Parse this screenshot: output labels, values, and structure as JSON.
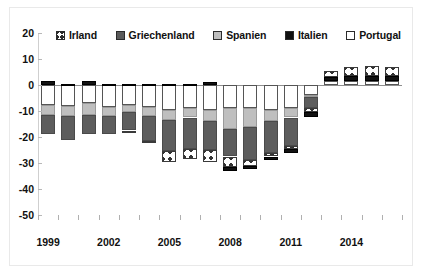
{
  "chart_data": {
    "type": "bar",
    "stacked": true,
    "title": "",
    "subtitle": "",
    "xlabel": "",
    "ylabel": "",
    "ylim": [
      -50,
      20
    ],
    "ytick_step": 10,
    "ytick_labels": [
      "20",
      "10",
      "0",
      "-10",
      "-20",
      "-30",
      "-40",
      "-50"
    ],
    "ytick_values": [
      20,
      10,
      0,
      -10,
      -20,
      -30,
      -40,
      -50
    ],
    "grid": false,
    "legend_position": "top",
    "x": [
      1999,
      2000,
      2001,
      2002,
      2003,
      2004,
      2005,
      2006,
      2007,
      2008,
      2009,
      2010,
      2011,
      2012,
      2013,
      2014,
      2015,
      2016
    ],
    "xtick_labels": [
      "1999",
      "2002",
      "2005",
      "2008",
      "2011",
      "2014"
    ],
    "xtick_values": [
      1999,
      2002,
      2005,
      2008,
      2011,
      2014
    ],
    "categories": [
      "1999",
      "2000",
      "2001",
      "2002",
      "2003",
      "2004",
      "2005",
      "2006",
      "2007",
      "2008",
      "2009",
      "2010",
      "2011",
      "2012",
      "2013",
      "2014",
      "2015",
      "2016"
    ],
    "series": [
      {
        "name": "Irland",
        "color": "#ffffff",
        "pattern": "cross-hatch",
        "values": [
          0,
          0,
          0,
          0,
          -0.5,
          -0.5,
          -4,
          -4,
          -4.5,
          -4,
          -2,
          -1.5,
          -1,
          -1.5,
          2.5,
          3.5,
          4,
          3.5
        ]
      },
      {
        "name": "Griechenland",
        "color": "#5d5d5d",
        "values": [
          -7.5,
          -9,
          -7.5,
          -7,
          -7,
          -9.5,
          -12,
          -12,
          -11,
          -10.5,
          -13,
          -12,
          -11,
          -4.5,
          0,
          0,
          0,
          0
        ]
      },
      {
        "name": "Spanien",
        "color": "#bfbfbf",
        "values": [
          -4,
          -4,
          -4.5,
          -3.5,
          -3,
          -3.5,
          -4,
          -3.5,
          -4.5,
          -8,
          -7,
          -4.5,
          -3.5,
          -0.5,
          0,
          0,
          0,
          0
        ]
      },
      {
        "name": "Italien",
        "color": "#121212",
        "values": [
          1.5,
          0.5,
          1.5,
          0.5,
          0.5,
          0.5,
          0.5,
          0.5,
          1,
          -1.5,
          -1.5,
          -1.5,
          -1.5,
          -2,
          1.5,
          2,
          2,
          2
        ]
      },
      {
        "name": "Portugal",
        "color": "#ffffff",
        "values": [
          -7.5,
          -8,
          -7,
          -8.5,
          -7.5,
          -8.5,
          -9.5,
          -9,
          -9.5,
          -9,
          -9,
          -9.5,
          -9,
          -4,
          1.5,
          1.5,
          1.5,
          1.5
        ]
      }
    ]
  },
  "legend": {
    "items": [
      {
        "label": "Irland",
        "swatch": "irland"
      },
      {
        "label": "Griechenland",
        "swatch": "griechenland"
      },
      {
        "label": "Spanien",
        "swatch": "spanien"
      },
      {
        "label": "Italien",
        "swatch": "italien"
      },
      {
        "label": "Portugal",
        "swatch": "portugal"
      }
    ]
  }
}
